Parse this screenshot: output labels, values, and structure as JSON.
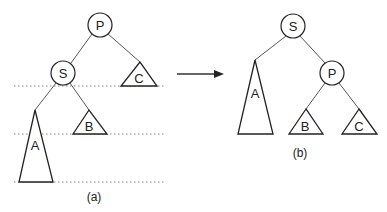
{
  "diagram": {
    "type": "tree-rotation",
    "colors": {
      "stroke": "#222222",
      "edge": "#555555",
      "dotted": "#888888",
      "background": "#ffffff"
    },
    "before": {
      "caption": "(a)",
      "nodes": {
        "root": "P",
        "child": "S"
      },
      "subtrees": {
        "a": "A",
        "b": "B",
        "c": "C"
      }
    },
    "after": {
      "caption": "(b)",
      "nodes": {
        "root": "S",
        "child": "P"
      },
      "subtrees": {
        "a": "A",
        "b": "B",
        "c": "C"
      }
    },
    "arrow": {
      "direction": "right"
    },
    "level_lines": 3
  }
}
